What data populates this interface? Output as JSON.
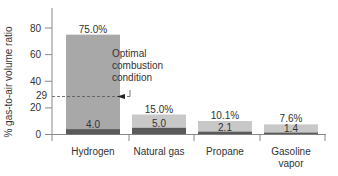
{
  "chart_data": {
    "type": "bar",
    "title": "",
    "xlabel": "",
    "ylabel": "% gas-to-air volume ratio",
    "ylim": [
      0,
      90
    ],
    "yticks": [
      0,
      20,
      29,
      40,
      60,
      80
    ],
    "categories": [
      "Hydrogen",
      "Natural gas",
      "Propane",
      "Gasoline vapor"
    ],
    "series": [
      {
        "name": "Upper flammability limit",
        "values": [
          75.0,
          15.0,
          10.1,
          7.6
        ],
        "labels": [
          "75.0%",
          "15.0%",
          "10.1%",
          "7.6%"
        ]
      },
      {
        "name": "Lower flammability limit",
        "values": [
          4.0,
          5.0,
          2.1,
          1.4
        ],
        "labels": [
          "4.0",
          "5.0",
          "2.1",
          "1.4"
        ]
      }
    ],
    "annotations": [
      {
        "text": "Optimal combustion condition",
        "y": 29,
        "style": "dashed reference line with arrow pointing to Hydrogen"
      }
    ],
    "colors": {
      "upper": "#a8a8a8",
      "lower": "#5a5a5a",
      "upper_light": "#c8c8c8"
    },
    "grid": false,
    "legend": "none"
  },
  "labels": {
    "ylabel": "% gas-to-air volume ratio",
    "annotation_lines": [
      "Optimal",
      "combustion",
      "condition"
    ],
    "cat_lines": [
      [
        "Hydrogen"
      ],
      [
        "Natural gas"
      ],
      [
        "Propane"
      ],
      [
        "Gasoline",
        "vapor"
      ]
    ],
    "ytick_labels": [
      "0",
      "20",
      "29",
      "40",
      "60",
      "80"
    ]
  }
}
